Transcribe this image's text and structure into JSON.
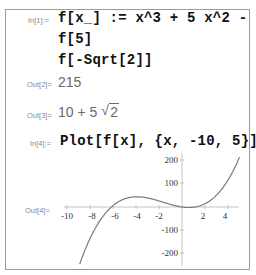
{
  "cells": [
    {
      "in_label": "In[1]:=",
      "lines": [
        "f[x_] := x^3 + 5 x^2 - 7 x",
        "f[5]",
        "f[-Sqrt[2]]"
      ]
    }
  ],
  "outputs": {
    "out2_label": "Out[2]=",
    "out2_value": "215",
    "out3_label": "Out[3]=",
    "out3_prefix": "10 + 5",
    "out3_radical": "√",
    "out3_radicand": "2"
  },
  "cell4": {
    "in_label": "In[4]:=",
    "code": "Plot[f[x], {x, -10, 5}]",
    "out_label": "Out[4]="
  },
  "chart_data": {
    "type": "line",
    "title": "",
    "function": "x^3 + 5 x^2 - 7 x",
    "xlabel": "",
    "ylabel": "",
    "xlim": [
      -10,
      5
    ],
    "ylim": [
      -250,
      230
    ],
    "x_ticks": [
      "-10",
      "-8",
      "-6",
      "-4",
      "-2",
      "2",
      "4"
    ],
    "y_ticks": [
      "200",
      "100",
      "-100",
      "-200"
    ],
    "series": [
      {
        "name": "f[x]",
        "x": [
          -9,
          -8,
          -7,
          -6,
          -5,
          -4,
          -3,
          -2,
          -1,
          0,
          1,
          2,
          3,
          4,
          5
        ],
        "y": [
          -261,
          -136,
          -49,
          6,
          35,
          44,
          39,
          26,
          11,
          0,
          -1,
          14,
          51,
          116,
          215
        ]
      }
    ],
    "grid": false,
    "axes_origin": [
      0,
      0
    ],
    "curve_color": "#7a7a7a"
  }
}
